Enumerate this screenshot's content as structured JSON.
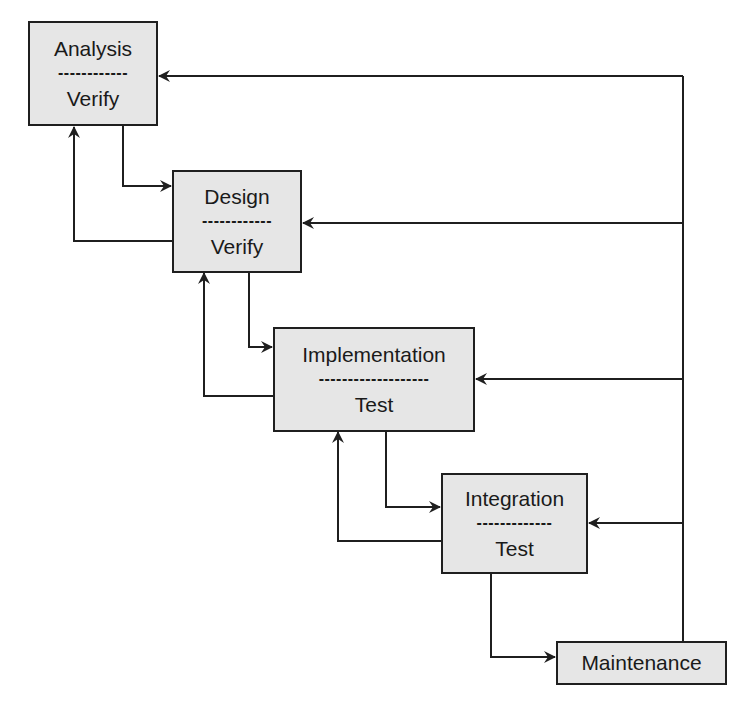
{
  "diagram": {
    "type": "waterfall-lifecycle",
    "colors": {
      "box_fill": "#e6e6e6",
      "stroke": "#1f1f1f",
      "background": "#ffffff"
    },
    "stages": [
      {
        "id": "analysis",
        "title": "Analysis",
        "separator": "------------",
        "activity": "Verify"
      },
      {
        "id": "design",
        "title": "Design",
        "separator": "------------",
        "activity": "Verify"
      },
      {
        "id": "implementation",
        "title": "Implementation",
        "separator": "-------------------",
        "activity": "Test"
      },
      {
        "id": "integration",
        "title": "Integration",
        "separator": "-------------",
        "activity": "Test"
      },
      {
        "id": "maintenance",
        "title": "Maintenance"
      }
    ],
    "edges": [
      {
        "from": "analysis",
        "to": "design",
        "kind": "forward"
      },
      {
        "from": "design",
        "to": "analysis",
        "kind": "back"
      },
      {
        "from": "design",
        "to": "implementation",
        "kind": "forward"
      },
      {
        "from": "implementation",
        "to": "design",
        "kind": "back"
      },
      {
        "from": "implementation",
        "to": "integration",
        "kind": "forward"
      },
      {
        "from": "integration",
        "to": "implementation",
        "kind": "back"
      },
      {
        "from": "integration",
        "to": "maintenance",
        "kind": "forward"
      },
      {
        "from": "maintenance",
        "to": "analysis",
        "kind": "feedback"
      },
      {
        "from": "maintenance",
        "to": "design",
        "kind": "feedback"
      },
      {
        "from": "maintenance",
        "to": "implementation",
        "kind": "feedback"
      },
      {
        "from": "maintenance",
        "to": "integration",
        "kind": "feedback"
      }
    ]
  }
}
